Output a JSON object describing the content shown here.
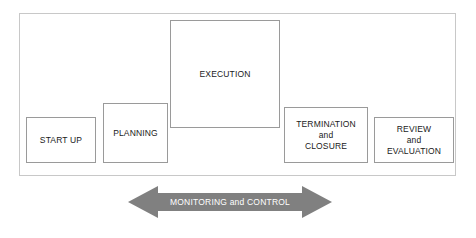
{
  "diagram": {
    "type": "process-lifecycle",
    "colors": {
      "frame_border": "#c8c8c8",
      "box_border": "#9a9a9a",
      "box_fill": "#ffffff",
      "text": "#1a1a1a",
      "arrow_fill": "#808080",
      "arrow_text": "#ffffff",
      "background": "#ffffff"
    },
    "phases": [
      {
        "id": "start-up",
        "label": "START UP",
        "order": 1
      },
      {
        "id": "planning",
        "label": "PLANNING",
        "order": 2
      },
      {
        "id": "execution",
        "label": "EXECUTION",
        "order": 3
      },
      {
        "id": "termination-and-closure",
        "label": "TERMINATION\nand\nCLOSURE",
        "order": 4
      },
      {
        "id": "review-and-evaluation",
        "label": "REVIEW\nand\nEVALUATION",
        "order": 5
      }
    ],
    "control_arrow": {
      "label": "MONITORING and CONTROL",
      "direction": "bidirectional",
      "fill": "#808080"
    }
  }
}
